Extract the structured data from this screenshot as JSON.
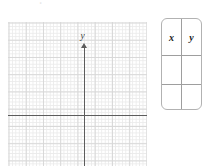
{
  "page": {
    "background_color": "#ffffff",
    "width": 210,
    "height": 166
  },
  "graph": {
    "name": "cartesian-coordinate-plane",
    "x_axis_label": "x",
    "y_axis_label": "y",
    "grid_minor_color": "#ebebeb",
    "grid_major_color": "#d8d8d8",
    "axis_color": "#5c5c5c",
    "minor_cells_per_major": 5
  },
  "table": {
    "name": "xy-value-table",
    "border_color": "#b2b2b2",
    "divider_color": "#9e9e9e",
    "headers": [
      "x",
      "y"
    ],
    "rows": [
      [
        "",
        ""
      ],
      [
        "",
        ""
      ]
    ]
  },
  "artifacts": {
    "stray_mark": "˚"
  },
  "chart_data": {
    "type": "scatter",
    "title": "",
    "xlabel": "x",
    "ylabel": "y",
    "series": [
      {
        "name": "plotted-points",
        "x": [],
        "y": []
      }
    ],
    "xlim": [
      -10,
      10
    ],
    "ylim": [
      -12,
      10
    ],
    "grid": true,
    "legend": false
  }
}
